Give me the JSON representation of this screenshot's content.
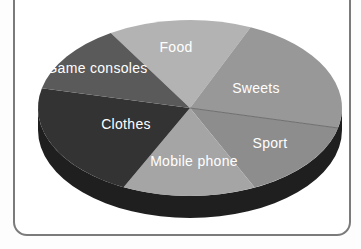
{
  "frame": {
    "border_color": "#7b7b7b",
    "background": "#ffffff"
  },
  "chart_data": {
    "type": "pie",
    "style": "3d",
    "title": "",
    "legend": "labels-rendered-on-slices",
    "values_shown": false,
    "rim_color": "#1f1f1f",
    "label_color": "#ffffff",
    "divider_after": "Sweets",
    "divider_color": "#6f6f6f",
    "slices": [
      {
        "label": "Food",
        "start_deg": -136.5,
        "end_deg": -53.1,
        "share_pct": 23.2,
        "color": "#b3b3b3",
        "label_x": 176,
        "label_y": 52
      },
      {
        "label": "Sweets",
        "start_deg": -53.1,
        "end_deg": 7.7,
        "share_pct": 16.9,
        "color": "#989898",
        "label_x": 256,
        "label_y": 93
      },
      {
        "label": "Sport",
        "start_deg": 7.7,
        "end_deg": 50.9,
        "share_pct": 12.0,
        "color": "#8d8d8d",
        "label_x": 270,
        "label_y": 148
      },
      {
        "label": "Mobile phone",
        "start_deg": 50.9,
        "end_deg": 130.0,
        "share_pct": 22.0,
        "color": "#a5a5a5",
        "label_x": 194,
        "label_y": 166
      },
      {
        "label": "Clothes",
        "start_deg": 130.0,
        "end_deg": 187.6,
        "share_pct": 16.0,
        "color": "#333333",
        "label_x": 126,
        "label_y": 129
      },
      {
        "label": "Game consoles",
        "start_deg": 187.6,
        "end_deg": 223.5,
        "share_pct": 10.0,
        "color": "#5a5a5a",
        "label_x": 97,
        "label_y": 73
      }
    ]
  }
}
